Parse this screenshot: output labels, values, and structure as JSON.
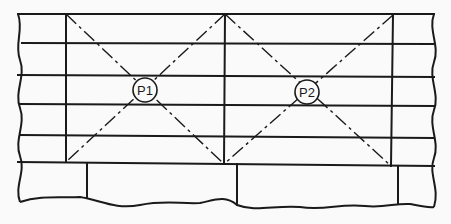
{
  "diagram": {
    "points": [
      {
        "id": "p1",
        "label": "P1"
      },
      {
        "id": "p2",
        "label": "P2"
      }
    ],
    "colors": {
      "ink": "#1a1a1a",
      "paper": "#fafafa"
    }
  }
}
